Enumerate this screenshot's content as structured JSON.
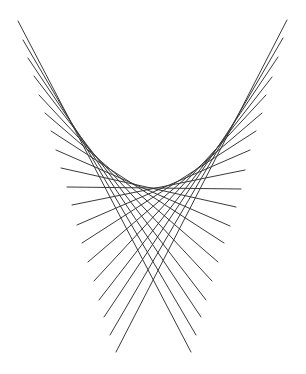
{
  "diagram": {
    "title": "",
    "stroke_color": "#3a3a3a",
    "background_color": "#ffffff",
    "lines": [
      {
        "id": "left-1",
        "x1": 18,
        "y1": 21,
        "x2": 191,
        "y2": 352
      },
      {
        "id": "left-2",
        "x1": 23,
        "y1": 40,
        "x2": 196,
        "y2": 335
      },
      {
        "id": "left-3",
        "x1": 28,
        "y1": 58,
        "x2": 201,
        "y2": 317
      },
      {
        "id": "left-4",
        "x1": 34,
        "y1": 76,
        "x2": 206,
        "y2": 300
      },
      {
        "id": "left-5",
        "x1": 39,
        "y1": 95,
        "x2": 212,
        "y2": 281
      },
      {
        "id": "left-6",
        "x1": 45,
        "y1": 113,
        "x2": 218,
        "y2": 262
      },
      {
        "id": "left-7",
        "x1": 51,
        "y1": 131,
        "x2": 224,
        "y2": 243
      },
      {
        "id": "left-8",
        "x1": 56,
        "y1": 150,
        "x2": 230,
        "y2": 226
      },
      {
        "id": "left-9",
        "x1": 61,
        "y1": 168,
        "x2": 236,
        "y2": 207
      },
      {
        "id": "center",
        "x1": 67,
        "y1": 187,
        "x2": 241,
        "y2": 189
      },
      {
        "id": "right-9",
        "x1": 245,
        "y1": 170,
        "x2": 72,
        "y2": 205
      },
      {
        "id": "right-8",
        "x1": 250,
        "y1": 150,
        "x2": 77,
        "y2": 225
      },
      {
        "id": "right-7",
        "x1": 256,
        "y1": 131,
        "x2": 82,
        "y2": 243
      },
      {
        "id": "right-6",
        "x1": 262,
        "y1": 113,
        "x2": 88,
        "y2": 262
      },
      {
        "id": "right-5",
        "x1": 266,
        "y1": 95,
        "x2": 94,
        "y2": 281
      },
      {
        "id": "right-4",
        "x1": 272,
        "y1": 77,
        "x2": 99,
        "y2": 300
      },
      {
        "id": "right-3",
        "x1": 278,
        "y1": 57,
        "x2": 104,
        "y2": 317
      },
      {
        "id": "right-2",
        "x1": 283,
        "y1": 38,
        "x2": 110,
        "y2": 335
      },
      {
        "id": "right-1",
        "x1": 287,
        "y1": 20,
        "x2": 116,
        "y2": 352
      }
    ]
  }
}
